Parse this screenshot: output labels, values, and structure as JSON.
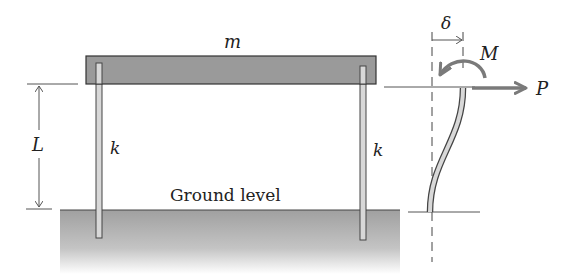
{
  "diagram": {
    "labels": {
      "mass": "m",
      "length": "L",
      "stiffness_left": "k",
      "stiffness_right": "k",
      "ground": "Ground level",
      "deflection": "δ",
      "moment": "M",
      "force": "P"
    },
    "colors": {
      "beam_fill": "#9a9a9a",
      "ground_fill": "#a8a8a8",
      "line": "#333333",
      "arrow": "#7a7a7a",
      "post_fill": "#d8d8d8"
    }
  }
}
